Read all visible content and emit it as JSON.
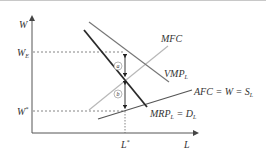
{
  "diagram": {
    "axes": {
      "y_label": "W",
      "x_label": "L"
    },
    "levels": {
      "w_e": {
        "main": "W",
        "sub": "E"
      },
      "w_star": {
        "main": "W",
        "sup": "*"
      },
      "l_star": {
        "main": "L",
        "sup": "*"
      }
    },
    "curves": {
      "mfc": {
        "label": "MFC",
        "color": "#b8b8b8"
      },
      "vmp": {
        "label_main": "VMP",
        "label_sub": "L",
        "color": "#777777"
      },
      "mrp": {
        "label_main": "MRP",
        "label_sub": "L",
        "label_rest": " = D",
        "label_sub2": "L",
        "color": "#2a2a2a"
      },
      "afc": {
        "label_main": "AFC = W = S",
        "label_sub": "L",
        "color": "#555555"
      }
    },
    "markers": {
      "a": "a",
      "b": "b"
    }
  }
}
